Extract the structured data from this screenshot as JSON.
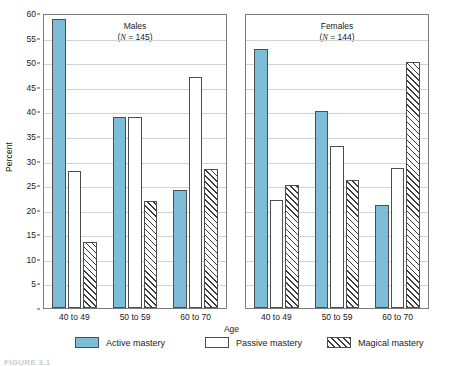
{
  "chart_data": {
    "type": "bar",
    "title": "",
    "xlabel": "Age",
    "ylabel": "Percent",
    "ylim": [
      0,
      60
    ],
    "ytick_step": 5,
    "yticks": [
      0,
      5,
      10,
      15,
      20,
      25,
      30,
      35,
      40,
      45,
      50,
      55,
      60
    ],
    "ytick_labels": [
      "",
      "5",
      "10",
      "15",
      "20",
      "25",
      "30",
      "35",
      "40",
      "45",
      "50",
      "55",
      "60"
    ],
    "grid": true,
    "legend_position": "bottom",
    "categories": [
      "40 to 49",
      "50 to 59",
      "60 to 70"
    ],
    "panels": [
      {
        "name": "males",
        "title": "Males",
        "n_prefix": "(",
        "n_symbol": "N",
        "n_value": " = 145)",
        "n_text": "(N = 145)",
        "series": [
          {
            "name": "Active mastery",
            "key": "active",
            "values": [
              58.7,
              38.9,
              24.0
            ]
          },
          {
            "name": "Passive mastery",
            "key": "passive",
            "values": [
              27.8,
              38.9,
              47.0
            ]
          },
          {
            "name": "Magical mastery",
            "key": "magical",
            "values": [
              13.4,
              21.7,
              28.2
            ]
          }
        ]
      },
      {
        "name": "females",
        "title": "Females",
        "n_prefix": "(",
        "n_symbol": "N",
        "n_value": " = 144)",
        "n_text": "(N = 144)",
        "series": [
          {
            "name": "Active mastery",
            "key": "active",
            "values": [
              52.7,
              40.0,
              21.0
            ]
          },
          {
            "name": "Passive mastery",
            "key": "passive",
            "values": [
              22.0,
              33.0,
              28.5
            ]
          },
          {
            "name": "Magical mastery",
            "key": "magical",
            "values": [
              25.0,
              26.0,
              50.0
            ]
          }
        ]
      }
    ],
    "legend": [
      {
        "label": "Active mastery",
        "key": "active",
        "color": "#7dbdd8"
      },
      {
        "label": "Passive mastery",
        "key": "passive",
        "color": "#ffffff"
      },
      {
        "label": "Magical mastery",
        "key": "magical",
        "color": "#ffffff"
      }
    ],
    "colors": {
      "active": "#7dbdd8",
      "passive": "#ffffff",
      "magical_hatch": "#3c3c3c",
      "frame": "#7d7d7d",
      "grid": "#d2d2d2"
    }
  },
  "caption": "FIGURE 3.1"
}
